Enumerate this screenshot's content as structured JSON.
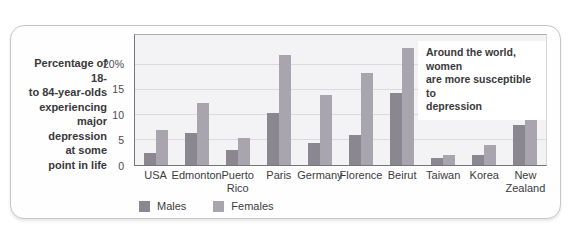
{
  "figure": {
    "title_lines": "Percentage of 18-\nto 84-year-olds\nexperiencing\nmajor\ndepression\nat some\npoint in life",
    "annotation_lines": "Around the world, women\nare more susceptible to\ndepression"
  },
  "chart_data": {
    "type": "bar",
    "title": "Percentage of 18- to 84-year-olds experiencing major depression at some point in life",
    "annotation": "Around the world, women are more susceptible to depression",
    "categories": [
      "USA",
      "Edmonton",
      "Puerto\nRico",
      "Paris",
      "Germany",
      "Florence",
      "Beirut",
      "Taiwan",
      "Korea",
      "New\nZealand"
    ],
    "series": [
      {
        "name": "Males",
        "color": "#8a8790",
        "values": [
          2.5,
          6.5,
          3.0,
          10.5,
          4.5,
          6.0,
          14.5,
          1.5,
          2.0,
          8.0
        ]
      },
      {
        "name": "Females",
        "color": "#a8a5ae",
        "values": [
          7.0,
          12.5,
          5.5,
          22.0,
          14.0,
          18.5,
          23.5,
          2.0,
          4.0,
          16.0
        ]
      }
    ],
    "xlabel": "",
    "ylabel": "",
    "ylim": [
      0,
      26
    ],
    "yticks": [
      {
        "value": 20,
        "label": "20%"
      },
      {
        "value": 15,
        "label": "15"
      },
      {
        "value": 10,
        "label": "10"
      },
      {
        "value": 5,
        "label": "5"
      },
      {
        "value": 0,
        "label": "0"
      }
    ],
    "gridlines": [
      5,
      10,
      15,
      20
    ],
    "grid": true,
    "legend_position": "bottom"
  }
}
